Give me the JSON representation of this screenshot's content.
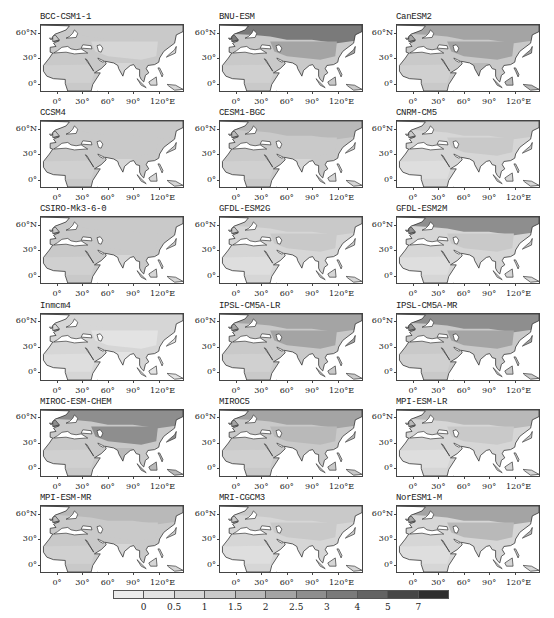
{
  "chart_data": {
    "type": "heatmap",
    "title": "",
    "xlabel": "",
    "ylabel": "",
    "x_ticks": [
      "0°",
      "30°",
      "60°",
      "90°",
      "120°E"
    ],
    "y_ticks": [
      "60°N",
      "30°",
      "0°"
    ],
    "lon_range": [
      -20,
      150
    ],
    "lat_range": [
      -10,
      70
    ],
    "colorbar": {
      "labels": [
        "0",
        "0.5",
        "1",
        "1.5",
        "2",
        "2.5",
        "3",
        "4",
        "5",
        "7"
      ],
      "colors": [
        "#ececec",
        "#e3e3e3",
        "#d6d6d6",
        "#c9c9c9",
        "#b9b9b9",
        "#a4a4a4",
        "#8e8e8e",
        "#7a7a7a",
        "#636363",
        "#464646",
        "#2e2e2e"
      ]
    },
    "panels": [
      {
        "name": "BCC-CSM1-1",
        "levels": {
          "north": 3,
          "central": 2,
          "africa": 3,
          "south_asia": 2
        }
      },
      {
        "name": "BNU-ESM",
        "levels": {
          "north": 7,
          "central": 5,
          "africa": 3,
          "south_asia": 3
        }
      },
      {
        "name": "CanESM2",
        "levels": {
          "north": 5,
          "central": 5,
          "africa": 3,
          "south_asia": 4
        }
      },
      {
        "name": "CCSM4",
        "levels": {
          "north": 3,
          "central": 3,
          "africa": 3,
          "south_asia": 2
        }
      },
      {
        "name": "CESM1-BGC",
        "levels": {
          "north": 4,
          "central": 3,
          "africa": 3,
          "south_asia": 2
        }
      },
      {
        "name": "CNRM-CM5",
        "levels": {
          "north": 3,
          "central": 3,
          "africa": 2,
          "south_asia": 2
        }
      },
      {
        "name": "CSIRO-Mk3-6-0",
        "levels": {
          "north": 3,
          "central": 3,
          "africa": 3,
          "south_asia": 2
        }
      },
      {
        "name": "GFDL-ESM2G",
        "levels": {
          "north": 3,
          "central": 3,
          "africa": 2,
          "south_asia": 2
        }
      },
      {
        "name": "GFDL-ESM2M",
        "levels": {
          "north": 6,
          "central": 3,
          "africa": 2,
          "south_asia": 2
        }
      },
      {
        "name": "Inmcm4",
        "levels": {
          "north": 2,
          "central": 1,
          "africa": 2,
          "south_asia": 1
        }
      },
      {
        "name": "IPSL-CM5A-LR",
        "levels": {
          "north": 5,
          "central": 5,
          "africa": 3,
          "south_asia": 3
        }
      },
      {
        "name": "IPSL-CM5A-MR",
        "levels": {
          "north": 6,
          "central": 5,
          "africa": 3,
          "south_asia": 3
        }
      },
      {
        "name": "MIROC-ESM-CHEM",
        "levels": {
          "north": 6,
          "central": 6,
          "africa": 3,
          "south_asia": 4
        }
      },
      {
        "name": "MIROC5",
        "levels": {
          "north": 5,
          "central": 4,
          "africa": 3,
          "south_asia": 3
        }
      },
      {
        "name": "MPI-ESM-LR",
        "levels": {
          "north": 4,
          "central": 3,
          "africa": 2,
          "south_asia": 2
        }
      },
      {
        "name": "MPI-ESM-MR",
        "levels": {
          "north": 4,
          "central": 3,
          "africa": 3,
          "south_asia": 2
        }
      },
      {
        "name": "MRI-CGCM3",
        "levels": {
          "north": 3,
          "central": 3,
          "africa": 2,
          "south_asia": 2
        }
      },
      {
        "name": "NorESM1-M",
        "levels": {
          "north": 5,
          "central": 4,
          "africa": 2,
          "south_asia": 2
        }
      }
    ],
    "legend_position": "bottom"
  }
}
